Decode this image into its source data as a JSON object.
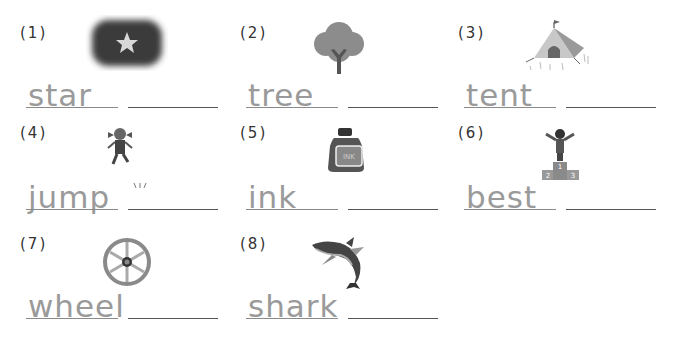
{
  "worksheet": {
    "items": [
      {
        "number": "(1)",
        "word": "star",
        "picture": "dark-cloud-with-star"
      },
      {
        "number": "(2)",
        "word": "tree",
        "picture": "tree"
      },
      {
        "number": "(3)",
        "word": "tent",
        "picture": "tent"
      },
      {
        "number": "(4)",
        "word": "jump",
        "picture": "jumping-girl"
      },
      {
        "number": "(5)",
        "word": "ink",
        "picture": "ink-bottle"
      },
      {
        "number": "(6)",
        "word": "best",
        "picture": "winner-on-podium"
      },
      {
        "number": "(7)",
        "word": "wheel",
        "picture": "wagon-wheel"
      },
      {
        "number": "(8)",
        "word": "shark",
        "picture": "shark"
      }
    ],
    "ink_label": "INK",
    "podium": {
      "first": "1",
      "second": "2",
      "third": "3"
    }
  },
  "colors": {
    "trace_text": "#9a9a9a",
    "line": "#555555",
    "label": "#333333"
  }
}
